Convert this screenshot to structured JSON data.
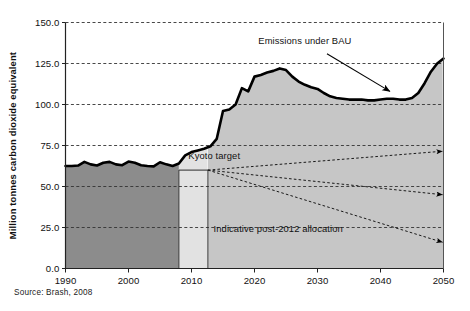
{
  "figure": {
    "source_note": "Source: Brash, 2008"
  },
  "chart_data": {
    "type": "area",
    "title": "",
    "xlabel": "",
    "ylabel": "Million tonnes carbon dioxide equivalent",
    "xlim": [
      1990,
      2050
    ],
    "ylim": [
      0,
      150
    ],
    "grid": true,
    "gridlines_y": [
      150.0,
      125.0,
      100.0,
      75.0,
      50.0,
      25.0,
      0.0
    ],
    "ytick_labels": [
      "150.0",
      "125.0",
      "100.0",
      "75.0",
      "50.0",
      "25.0",
      "0.0"
    ],
    "xtick_values": [
      1990,
      2000,
      2010,
      2020,
      2030,
      2040,
      2050
    ],
    "xtick_labels": [
      "1990",
      "2000",
      "2010",
      "2020",
      "2030",
      "2040",
      "2050"
    ],
    "legend_position": "none",
    "series": [
      {
        "name": "Emissions under BAU",
        "type": "area",
        "x": [
          1990,
          1991,
          1992,
          1993,
          1994,
          1995,
          1996,
          1997,
          1998,
          1999,
          2000,
          2001,
          2002,
          2003,
          2004,
          2005,
          2006,
          2007,
          2008,
          2009,
          2010,
          2011,
          2012,
          2013,
          2014,
          2015,
          2016,
          2017,
          2018,
          2019,
          2020,
          2021,
          2022,
          2023,
          2024,
          2025,
          2026,
          2027,
          2028,
          2029,
          2030,
          2031,
          2032,
          2033,
          2034,
          2035,
          2036,
          2037,
          2038,
          2039,
          2040,
          2041,
          2042,
          2043,
          2044,
          2045,
          2046,
          2047,
          2048,
          2049,
          2050
        ],
        "y": [
          62.5,
          62.5,
          62.8,
          65.0,
          63.5,
          62.8,
          64.5,
          65.0,
          63.5,
          63.0,
          65.2,
          64.5,
          63.0,
          62.5,
          62.3,
          64.8,
          63.5,
          62.5,
          64.0,
          69.0,
          71.0,
          72.0,
          73.0,
          74.5,
          79.0,
          96.0,
          97.0,
          100.0,
          110.0,
          108.0,
          117.0,
          118.0,
          119.5,
          120.5,
          122.0,
          121.0,
          117.0,
          114.0,
          112.0,
          110.5,
          109.5,
          107.0,
          105.0,
          104.0,
          103.5,
          103.0,
          103.0,
          103.0,
          102.5,
          102.5,
          103.0,
          103.5,
          103.5,
          103.0,
          103.0,
          104.0,
          107.0,
          113.0,
          120.0,
          125.0,
          128.0
        ]
      }
    ],
    "regions": [
      {
        "name": "historical",
        "x_start": 1990,
        "x_end": 2008,
        "fill": "#8c8c8c",
        "label": ""
      },
      {
        "name": "kyoto-commitment-period",
        "x_start": 2008,
        "x_end": 2012.6,
        "fill": "#e2e2e2",
        "label": ""
      },
      {
        "name": "post-2012",
        "x_start": 2012.6,
        "x_end": 2050,
        "fill": "#c6c6c6",
        "label": ""
      }
    ],
    "reference_lines": [
      {
        "name": "kyoto-target-level",
        "y": 60.0,
        "x_start": 2008,
        "x_end": 2012.6
      }
    ],
    "annotations": [
      {
        "name": "emissions-under-bau",
        "text": "Emissions under BAU",
        "text_x": 2028.0,
        "text_y": 137.0,
        "arrow_from": [
          2031.5,
          131.0
        ],
        "arrow_to": [
          2041.5,
          108.0
        ]
      },
      {
        "name": "kyoto-target",
        "text": "Kyoto target",
        "text_x": 2009.5,
        "text_y": 66.5,
        "arrow_from": null,
        "arrow_to": null
      },
      {
        "name": "indicative-post-2012-allocation",
        "text": "Indicative post-2012 allocation",
        "text_x": 2013.5,
        "text_y": 22.0,
        "arrow_from": null,
        "arrow_to": null
      }
    ],
    "allocation_arrows": [
      {
        "name": "allocation-path-high",
        "from": [
          2012.6,
          60.0
        ],
        "to": [
          2050,
          71.5
        ],
        "style": "dashed-arrow"
      },
      {
        "name": "allocation-path-mid",
        "from": [
          2012.6,
          60.0
        ],
        "to": [
          2050,
          45.0
        ],
        "style": "dashed-arrow"
      },
      {
        "name": "allocation-path-low",
        "from": [
          2012.6,
          60.0
        ],
        "to": [
          2050,
          16.0
        ],
        "style": "dashed-arrow"
      }
    ],
    "colors": {
      "historical_fill": "#8c8c8c",
      "kyoto_fill": "#e2e2e2",
      "post2012_fill": "#c6c6c6",
      "line": "#000000",
      "grid": "#333333",
      "text": "#111111"
    }
  }
}
